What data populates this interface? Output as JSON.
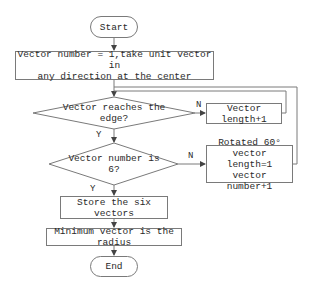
{
  "flowchart": {
    "start": {
      "label": "Start"
    },
    "init": {
      "label": "Vector number = 1,take unit vector in\nany direction at the center"
    },
    "decision_edge": {
      "label": "Vector reaches the edge?",
      "no_label": "N",
      "yes_label": "Y"
    },
    "increment_length": {
      "label": "Vector length+1"
    },
    "decision_count": {
      "label": "Vector number is 6?",
      "no_label": "N",
      "yes_label": "Y"
    },
    "rotate": {
      "label": "Rotated 60°\nvector length=1\nvector number+1"
    },
    "store": {
      "label": "Store the six vectors"
    },
    "minimum": {
      "label": "Minimum vector is the radius"
    },
    "end": {
      "label": "End"
    }
  },
  "colors": {
    "stroke": "#7a7a7a",
    "text": "#2a2a2a",
    "background": "#ffffff"
  }
}
